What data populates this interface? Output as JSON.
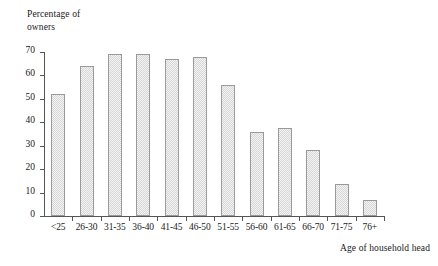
{
  "chart_data": {
    "type": "bar",
    "title": "",
    "ylabel": "Percentage of owners",
    "ylabel_lines": [
      "Percentage of",
      "owners"
    ],
    "xlabel": "Age of household head",
    "ylim": [
      0,
      70
    ],
    "yticks": [
      0,
      10,
      20,
      30,
      40,
      50,
      60,
      70
    ],
    "grid": false,
    "legend": null,
    "categories": [
      "<25",
      "26-30",
      "31-35",
      "36-40",
      "41-45",
      "46-50",
      "51-55",
      "56-60",
      "61-65",
      "66-70",
      "71-75",
      "76+"
    ],
    "values": [
      52,
      64,
      69,
      69,
      67,
      68,
      56,
      36,
      37.5,
      28,
      13.5,
      7
    ],
    "bars": [
      {
        "category": "<25",
        "value": 52
      },
      {
        "category": "26-30",
        "value": 64
      },
      {
        "category": "31-35",
        "value": 69
      },
      {
        "category": "36-40",
        "value": 69
      },
      {
        "category": "41-45",
        "value": 67
      },
      {
        "category": "46-50",
        "value": 68
      },
      {
        "category": "51-55",
        "value": 56
      },
      {
        "category": "56-60",
        "value": 36
      },
      {
        "category": "61-65",
        "value": 37.5
      },
      {
        "category": "66-70",
        "value": 28
      },
      {
        "category": "71-75",
        "value": 13.5
      },
      {
        "category": "76+",
        "value": 7
      }
    ],
    "colors": {
      "bar_fill": "#f3f3f3",
      "bar_border": "#9a9a9a",
      "axis": "#555555",
      "text": "#1a1a1a",
      "background": "#ffffff"
    }
  }
}
